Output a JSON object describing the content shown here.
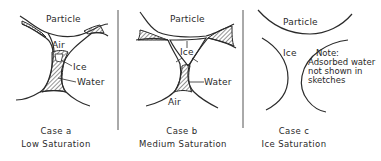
{
  "figure": {
    "panels": [
      {
        "id": "a",
        "labels": {
          "particle": "Particle",
          "air": "Air",
          "ice": "Ice",
          "water": "Water"
        },
        "caption": {
          "case": "Case  a",
          "title": "Low  Saturation"
        }
      },
      {
        "id": "b",
        "labels": {
          "particle": "Particle",
          "air": "Air",
          "ice": "Ice",
          "water": "Water"
        },
        "caption": {
          "case": "Case  b",
          "title": "Medium  Saturation"
        }
      },
      {
        "id": "c",
        "labels": {
          "particle": "Particle",
          "ice": "Ice"
        },
        "note": [
          "Note:",
          "Adsorbed water",
          "not  shown  in",
          "sketches"
        ],
        "caption": {
          "case": "Case  c",
          "title": "Ice  Saturation"
        }
      }
    ],
    "colors": {
      "line": "#2a2a2a",
      "hatch": "#3a3a3a",
      "background": "#ffffff"
    }
  }
}
